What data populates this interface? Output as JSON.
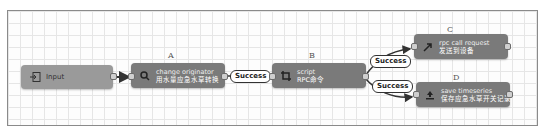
{
  "diagram": {
    "type": "rule-chain",
    "nodes": [
      {
        "id": "input",
        "tag": "",
        "name": "Input",
        "desc": "",
        "icon": "input-icon"
      },
      {
        "id": "A",
        "tag": "A",
        "name": "change originator",
        "desc": "用水量应急水草转换",
        "icon": "search-icon"
      },
      {
        "id": "B",
        "tag": "B",
        "name": "script",
        "desc": "RPC命令",
        "icon": "transform-icon"
      },
      {
        "id": "C",
        "tag": "C",
        "name": "rpc call request",
        "desc": "发送到设备",
        "icon": "arrow-up-right-icon"
      },
      {
        "id": "D",
        "tag": "D",
        "name": "save timeseries",
        "desc": "保存应急水草开关记录",
        "icon": "upload-icon"
      }
    ],
    "edges": [
      {
        "from": "input",
        "to": "A",
        "label": ""
      },
      {
        "from": "A",
        "to": "B",
        "label": "Success"
      },
      {
        "from": "B",
        "to": "C",
        "label": "Success"
      },
      {
        "from": "B",
        "to": "D",
        "label": "Success"
      }
    ]
  },
  "colors": {
    "input_node": "#9a9a9a",
    "action_node": "#7a7a7a",
    "grid": "#e6e6e6",
    "edge": "#333333"
  }
}
